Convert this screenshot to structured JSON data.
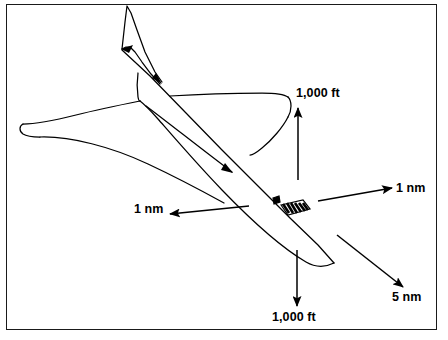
{
  "diagram": {
    "type": "aircraft-wake-separation-diagram",
    "frame": {
      "border_color": "#1a1a1a",
      "background": "#ffffff"
    },
    "stroke_color": "#000000",
    "labels": {
      "top_altitude": "1,000 ft",
      "bottom_altitude": "1,000 ft",
      "right_distance": "1 nm",
      "left_distance": "1 nm",
      "trailing_distance": "5 nm"
    },
    "annotations": [
      {
        "name": "top-altitude",
        "text": "1,000 ft",
        "arrow": "up",
        "units": "ft",
        "value": 1000
      },
      {
        "name": "bottom-altitude",
        "text": "1,000 ft",
        "arrow": "down",
        "units": "ft",
        "value": 1000
      },
      {
        "name": "right-distance",
        "text": "1 nm",
        "arrow": "right",
        "units": "nm",
        "value": 1
      },
      {
        "name": "left-distance",
        "text": "1 nm",
        "arrow": "left",
        "units": "nm",
        "value": 1
      },
      {
        "name": "trailing-distance",
        "text": "5 nm",
        "arrow": "down-right",
        "units": "nm",
        "value": 5
      }
    ]
  }
}
